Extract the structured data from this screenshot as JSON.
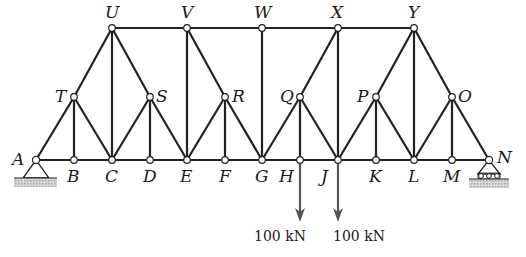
{
  "diagram": {
    "type": "truss",
    "nodes": {
      "A": {
        "x": 36,
        "y": 160,
        "label": "A",
        "label_pos": "left"
      },
      "B": {
        "x": 74,
        "y": 160,
        "label": "B",
        "label_pos": "below"
      },
      "C": {
        "x": 112,
        "y": 160,
        "label": "C",
        "label_pos": "below"
      },
      "D": {
        "x": 150,
        "y": 160,
        "label": "D",
        "label_pos": "below"
      },
      "E": {
        "x": 187,
        "y": 160,
        "label": "E",
        "label_pos": "below"
      },
      "F": {
        "x": 225,
        "y": 160,
        "label": "F",
        "label_pos": "below"
      },
      "G": {
        "x": 262,
        "y": 160,
        "label": "G",
        "label_pos": "below"
      },
      "H": {
        "x": 300,
        "y": 160,
        "label": "H",
        "label_pos": "below-left"
      },
      "J": {
        "x": 338,
        "y": 160,
        "label": "J",
        "label_pos": "below-left"
      },
      "K": {
        "x": 376,
        "y": 160,
        "label": "K",
        "label_pos": "below"
      },
      "L": {
        "x": 414,
        "y": 160,
        "label": "L",
        "label_pos": "below"
      },
      "M": {
        "x": 452,
        "y": 160,
        "label": "M",
        "label_pos": "below"
      },
      "N": {
        "x": 489,
        "y": 160,
        "label": "N",
        "label_pos": "right"
      },
      "T": {
        "x": 74,
        "y": 97,
        "label": "T",
        "label_pos": "left"
      },
      "S": {
        "x": 150,
        "y": 97,
        "label": "S",
        "label_pos": "right"
      },
      "R": {
        "x": 225,
        "y": 97,
        "label": "R",
        "label_pos": "right"
      },
      "Q": {
        "x": 300,
        "y": 97,
        "label": "Q",
        "label_pos": "left"
      },
      "P": {
        "x": 376,
        "y": 97,
        "label": "P",
        "label_pos": "left"
      },
      "O": {
        "x": 452,
        "y": 97,
        "label": "O",
        "label_pos": "right"
      },
      "U": {
        "x": 112,
        "y": 28,
        "label": "U",
        "label_pos": "above"
      },
      "V": {
        "x": 187,
        "y": 28,
        "label": "V",
        "label_pos": "above"
      },
      "W": {
        "x": 262,
        "y": 28,
        "label": "W",
        "label_pos": "above"
      },
      "X": {
        "x": 338,
        "y": 28,
        "label": "X",
        "label_pos": "above"
      },
      "Y": {
        "x": 414,
        "y": 28,
        "label": "Y",
        "label_pos": "above"
      }
    },
    "members": [
      [
        "A",
        "B"
      ],
      [
        "B",
        "C"
      ],
      [
        "C",
        "D"
      ],
      [
        "D",
        "E"
      ],
      [
        "E",
        "F"
      ],
      [
        "F",
        "G"
      ],
      [
        "G",
        "H"
      ],
      [
        "H",
        "J"
      ],
      [
        "J",
        "K"
      ],
      [
        "K",
        "L"
      ],
      [
        "L",
        "M"
      ],
      [
        "M",
        "N"
      ],
      [
        "U",
        "V"
      ],
      [
        "V",
        "W"
      ],
      [
        "W",
        "X"
      ],
      [
        "X",
        "Y"
      ],
      [
        "A",
        "T"
      ],
      [
        "T",
        "U"
      ],
      [
        "U",
        "S"
      ],
      [
        "S",
        "E"
      ],
      [
        "T",
        "B"
      ],
      [
        "T",
        "C"
      ],
      [
        "S",
        "C"
      ],
      [
        "S",
        "D"
      ],
      [
        "U",
        "C"
      ],
      [
        "V",
        "E"
      ],
      [
        "V",
        "R"
      ],
      [
        "R",
        "G"
      ],
      [
        "R",
        "E"
      ],
      [
        "R",
        "F"
      ],
      [
        "W",
        "G"
      ],
      [
        "X",
        "Q"
      ],
      [
        "Q",
        "G"
      ],
      [
        "Q",
        "H"
      ],
      [
        "Q",
        "J"
      ],
      [
        "X",
        "J"
      ],
      [
        "J",
        "P"
      ],
      [
        "P",
        "Y"
      ],
      [
        "P",
        "K"
      ],
      [
        "P",
        "L"
      ],
      [
        "Y",
        "L"
      ],
      [
        "Y",
        "O"
      ],
      [
        "O",
        "N"
      ],
      [
        "O",
        "L"
      ],
      [
        "O",
        "M"
      ]
    ],
    "supports": [
      {
        "node": "A",
        "type": "pin"
      },
      {
        "node": "N",
        "type": "roller"
      }
    ],
    "loads": [
      {
        "node": "H",
        "magnitude": "100 kN",
        "direction": "down"
      },
      {
        "node": "J",
        "magnitude": "100 kN",
        "direction": "down"
      }
    ]
  },
  "labels": {
    "A": "A",
    "B": "B",
    "C": "C",
    "D": "D",
    "E": "E",
    "F": "F",
    "G": "G",
    "H": "H",
    "J": "J",
    "K": "K",
    "L": "L",
    "M": "M",
    "N": "N",
    "O": "O",
    "P": "P",
    "Q": "Q",
    "R": "R",
    "S": "S",
    "T": "T",
    "U": "U",
    "V": "V",
    "W": "W",
    "X": "X",
    "Y": "Y",
    "load_H": "100 kN",
    "load_J": "100 kN"
  }
}
